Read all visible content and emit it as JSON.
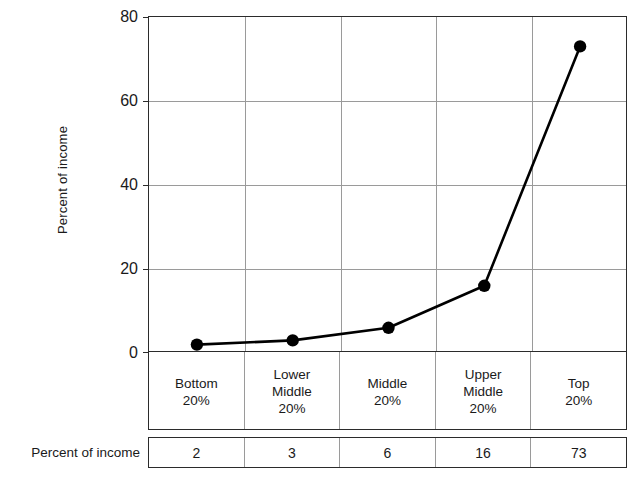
{
  "chart_data": {
    "type": "line",
    "title": "",
    "xlabel": "",
    "ylabel": "Percent of income",
    "ylim": [
      0,
      80
    ],
    "yticks": [
      0,
      20,
      40,
      60,
      80
    ],
    "grid": true,
    "legend": "none",
    "categories": [
      "Bottom\n20%",
      "Lower\nMiddle\n20%",
      "Middle\n20%",
      "Upper\nMiddle\n20%",
      "Top\n20%"
    ],
    "values": [
      2,
      3,
      6,
      16,
      73
    ],
    "marker": "filled-circle",
    "line_color": "#000000",
    "marker_color": "#000000"
  },
  "axis": {
    "y_title": "Percent of income",
    "y_tick_labels": [
      "80",
      "60",
      "40",
      "20",
      "0"
    ]
  },
  "categories": {
    "c0_line1": "Bottom",
    "c0_line2": "20%",
    "c1_line1": "Lower",
    "c1_line2": "Middle",
    "c1_line3": "20%",
    "c2_line1": "Middle",
    "c2_line2": "20%",
    "c3_line1": "Upper",
    "c3_line2": "Middle",
    "c3_line3": "20%",
    "c4_line1": "Top",
    "c4_line2": "20%"
  },
  "table": {
    "row_label": "Percent of income",
    "values": [
      "2",
      "3",
      "6",
      "16",
      "73"
    ]
  }
}
